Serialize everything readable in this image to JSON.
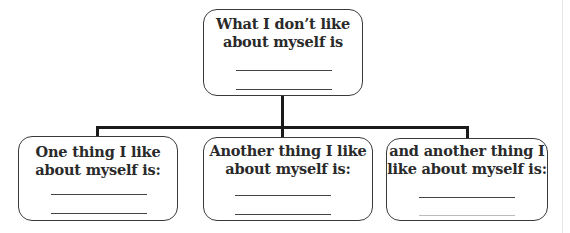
{
  "diagram": {
    "type": "tree",
    "root": {
      "label": "What I don’t like about myself is",
      "line1": "What I don’t like",
      "line2": "about myself is",
      "blank_lines": 2
    },
    "children": [
      {
        "label": "One thing I like about myself is:",
        "line1": "One thing I like",
        "line2": "about myself is:",
        "blank_lines": 2
      },
      {
        "label": "Another thing I like about myself is:",
        "line1": "Another thing I like",
        "line2": "about myself is:",
        "blank_lines": 2
      },
      {
        "label": "and another thing I like about myself is:",
        "line1": "and another thing I",
        "line2": "like about myself is:",
        "blank_lines": 2
      }
    ],
    "colors": {
      "border": "#3a3a3a",
      "connector": "#1a1a1a",
      "text": "#2a2a2a"
    }
  }
}
